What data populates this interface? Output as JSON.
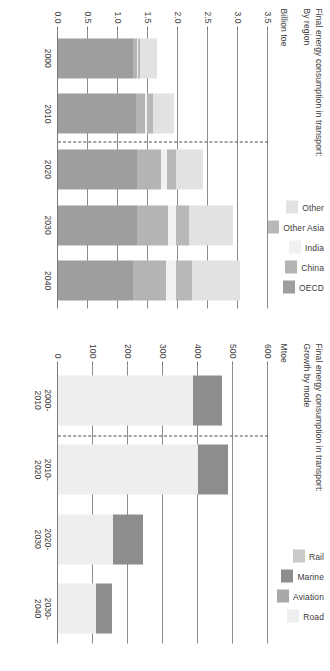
{
  "page": {
    "background": "#ffffff"
  },
  "charts": [
    {
      "id": "growth-by-mode",
      "title": "Final energy consumption in transport:\nGrowth by mode",
      "unit": "Mtoe",
      "legend": [
        {
          "label": "Rail",
          "color": "#c9c9c9"
        },
        {
          "label": "Marine",
          "color": "#8d8d8d"
        },
        {
          "label": "Aviation",
          "color": "#a8a8a8"
        },
        {
          "label": "Road",
          "color": "#eeeeee"
        }
      ]
    },
    {
      "id": "by-region",
      "title": "Final energy consumption in transport:\nBy region",
      "unit": "Billion toe",
      "legend": [
        {
          "label": "Other",
          "color": "#e2e2e2"
        },
        {
          "label": "Other Asia",
          "color": "#b8b8b8"
        },
        {
          "label": "India",
          "color": "#f1f1f1"
        },
        {
          "label": "China",
          "color": "#b4b4b4"
        },
        {
          "label": "OECD",
          "color": "#9e9e9e"
        }
      ]
    }
  ],
  "chart_data": [
    {
      "type": "bar",
      "id": "growth-by-mode",
      "title": "Final energy consumption in transport: Growth by mode",
      "subtitle": "Growth by mode",
      "ylabel": "Mtoe",
      "xlabel": "",
      "ylim": [
        0,
        600
      ],
      "yticks": [
        0,
        100,
        200,
        300,
        400,
        500,
        600
      ],
      "ytick_labels": [
        "0",
        "100",
        "200",
        "300",
        "400",
        "500",
        "600"
      ],
      "grid": true,
      "legend_position": "top-right",
      "note": "Stacked growth increments per decade; bars are stacked from 0 upward (Road, Aviation, Marine, Rail).",
      "categories": [
        "2000-\n2010",
        "2010-\n2020",
        "2020-\n2030",
        "2030-\n2040"
      ],
      "series": [
        {
          "name": "Road",
          "color": "#eeeeee",
          "values": [
            385,
            400,
            158,
            108
          ]
        },
        {
          "name": "Aviation",
          "color": "#a8a8a8",
          "values": [
            0,
            0,
            0,
            0
          ]
        },
        {
          "name": "Marine",
          "color": "#8d8d8d",
          "values": [
            85,
            85,
            85,
            45
          ]
        },
        {
          "name": "Rail",
          "color": "#c9c9c9",
          "values": [
            0,
            0,
            0,
            0
          ]
        }
      ],
      "totals": [
        470,
        485,
        243,
        153
      ],
      "history_forecast_divider_between": [
        "2000-2010",
        "2010-2020"
      ]
    },
    {
      "type": "bar",
      "id": "by-region",
      "title": "Final energy consumption in transport: By region",
      "subtitle": "By region",
      "ylabel": "Billion toe",
      "xlabel": "",
      "ylim": [
        0.0,
        3.5
      ],
      "yticks": [
        0.0,
        0.5,
        1.0,
        1.5,
        2.0,
        2.5,
        3.0,
        3.5
      ],
      "ytick_labels": [
        "0.0",
        "0.5",
        "1.0",
        "1.5",
        "2.0",
        "2.5",
        "3.0",
        "3.5"
      ],
      "grid": true,
      "legend_position": "top-right",
      "stacked": true,
      "categories": [
        "2000",
        "2010",
        "2020",
        "2030",
        "2040"
      ],
      "series": [
        {
          "name": "OECD",
          "color": "#9e9e9e",
          "values": [
            1.25,
            1.3,
            1.32,
            1.32,
            1.25
          ]
        },
        {
          "name": "China",
          "color": "#b4b4b4",
          "values": [
            0.06,
            0.15,
            0.4,
            0.52,
            0.55
          ]
        },
        {
          "name": "India",
          "color": "#f1f1f1",
          "values": [
            0.02,
            0.04,
            0.1,
            0.13,
            0.17
          ]
        },
        {
          "name": "Other Asia",
          "color": "#b8b8b8",
          "values": [
            0.04,
            0.1,
            0.14,
            0.21,
            0.26
          ]
        },
        {
          "name": "Other",
          "color": "#e2e2e2",
          "values": [
            0.28,
            0.35,
            0.45,
            0.73,
            0.8
          ]
        }
      ],
      "totals": [
        1.65,
        1.94,
        2.41,
        2.91,
        3.03
      ],
      "history_forecast_divider_between": [
        "2010",
        "2020"
      ]
    }
  ]
}
